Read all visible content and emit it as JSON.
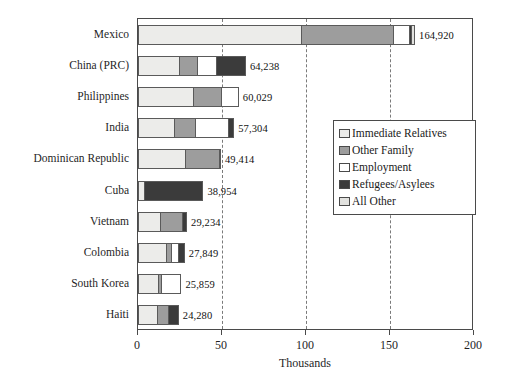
{
  "chart_data": {
    "type": "bar",
    "orientation": "horizontal",
    "stacked": true,
    "title": "",
    "subtitle": "",
    "xlabel": "Thousands",
    "ylabel": "",
    "xlim": [
      0,
      200
    ],
    "xticks": [
      0,
      50,
      100,
      150,
      200
    ],
    "xtick_labels": [
      "0",
      "50",
      "100",
      "150",
      "200"
    ],
    "grid": "vertical-dashed-at-50-100-150",
    "legend_position": "center-right",
    "categories": [
      "Mexico",
      "China (PRC)",
      "Philippines",
      "India",
      "Dominican Republic",
      "Cuba",
      "Vietnam",
      "Colombia",
      "South Korea",
      "Haiti"
    ],
    "series": [
      {
        "name": "Immediate Relatives",
        "color": "#ececea",
        "values": [
          97.0,
          24.0,
          33.0,
          21.0,
          28.0,
          3.0,
          13.0,
          17.0,
          12.0,
          11.0
        ]
      },
      {
        "name": "Other Family",
        "color": "#9d9d9d",
        "values": [
          55.0,
          11.0,
          17.0,
          13.0,
          21.0,
          0.0,
          14.0,
          3.0,
          2.0,
          7.0
        ]
      },
      {
        "name": "Employment",
        "color": "#ffffff",
        "values": [
          10.0,
          12.0,
          10.0,
          20.0,
          0.0,
          0.0,
          0.0,
          4.0,
          12.0,
          0.0
        ]
      },
      {
        "name": "Refugees/Asylees",
        "color": "#3b3b3b",
        "values": [
          1.0,
          17.2,
          0.0,
          3.3,
          0.0,
          36.0,
          2.2,
          3.8,
          0.0,
          6.3
        ]
      },
      {
        "name": "All Other",
        "color": "#e2e2df",
        "values": [
          1.9,
          0.0,
          0.0,
          0.0,
          0.4,
          0.0,
          0.0,
          0.0,
          0.0,
          0.0
        ]
      }
    ],
    "totals": [
      164.92,
      64.238,
      60.029,
      57.304,
      49.414,
      38.954,
      29.234,
      27.849,
      25.859,
      24.28
    ],
    "value_labels": [
      "164,920",
      "64,238",
      "60,029",
      "57,304",
      "49,414",
      "38,954",
      "29,234",
      "27,849",
      "25,859",
      "24,280"
    ]
  },
  "legend": {
    "items": [
      {
        "label": "Immediate Relatives",
        "color": "#ececea"
      },
      {
        "label": "Other Family",
        "color": "#9d9d9d"
      },
      {
        "label": "Employment",
        "color": "#ffffff"
      },
      {
        "label": "Refugees/Asylees",
        "color": "#3b3b3b"
      },
      {
        "label": "All Other",
        "color": "#e2e2df"
      }
    ]
  },
  "axis": {
    "x_title": "Thousands",
    "x_tick_labels": [
      "0",
      "50",
      "100",
      "150",
      "200"
    ]
  }
}
